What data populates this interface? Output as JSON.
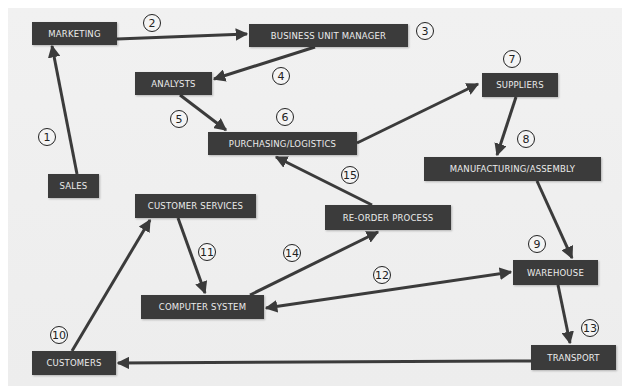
{
  "diagram": {
    "colors": {
      "node_fill": "#3b3b3b",
      "node_text": "#ececec",
      "arrow": "#3b3b3b",
      "background": "#eeeeee",
      "badge_border": "#222222"
    },
    "nodes": {
      "marketing": "MARKETING",
      "business_unit_manager": "BUSINESS UNIT MANAGER",
      "analysts": "ANALYSTS",
      "suppliers": "SUPPLIERS",
      "purchasing_logistics": "PURCHASING/LOGISTICS",
      "manufacturing_assembly": "MANUFACTURING/ASSEMBLY",
      "sales": "SALES",
      "customer_services": "CUSTOMER SERVICES",
      "reorder_process": "RE-ORDER PROCESS",
      "warehouse": "WAREHOUSE",
      "computer_system": "COMPUTER SYSTEM",
      "customers": "CUSTOMERS",
      "transport": "TRANSPORT"
    },
    "steps": {
      "s1": "1",
      "s2": "2",
      "s3": "3",
      "s4": "4",
      "s5": "5",
      "s6": "6",
      "s7": "7",
      "s8": "8",
      "s9": "9",
      "s10": "10",
      "s11": "11",
      "s12": "12",
      "s13": "13",
      "s14": "14",
      "s15": "15"
    },
    "edges": [
      {
        "from": "SALES",
        "to": "MARKETING",
        "step": "1"
      },
      {
        "from": "MARKETING",
        "to": "BUSINESS UNIT MANAGER",
        "step": "2"
      },
      {
        "from": "BUSINESS UNIT MANAGER",
        "to": "ANALYSTS",
        "step": "4"
      },
      {
        "from": "ANALYSTS",
        "to": "PURCHASING/LOGISTICS",
        "step": "5"
      },
      {
        "from": "PURCHASING/LOGISTICS",
        "to": "SUPPLIERS",
        "step": "6"
      },
      {
        "from": "SUPPLIERS",
        "to": "MANUFACTURING/ASSEMBLY",
        "step": "8"
      },
      {
        "from": "MANUFACTURING/ASSEMBLY",
        "to": "WAREHOUSE",
        "step": "9"
      },
      {
        "from": "CUSTOMERS",
        "to": "CUSTOMER SERVICES",
        "step": "10"
      },
      {
        "from": "CUSTOMER SERVICES",
        "to": "COMPUTER SYSTEM",
        "step": "11"
      },
      {
        "from": "COMPUTER SYSTEM",
        "to": "WAREHOUSE",
        "step": "12",
        "bidirectional": true
      },
      {
        "from": "WAREHOUSE",
        "to": "TRANSPORT",
        "step": "13"
      },
      {
        "from": "TRANSPORT",
        "to": "CUSTOMERS",
        "step": "13"
      },
      {
        "from": "COMPUTER SYSTEM",
        "to": "RE-ORDER PROCESS",
        "step": "14"
      },
      {
        "from": "RE-ORDER PROCESS",
        "to": "PURCHASING/LOGISTICS",
        "step": "15"
      }
    ]
  }
}
